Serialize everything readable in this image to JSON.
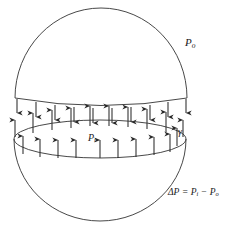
{
  "figure": {
    "stroke_color": "#333333",
    "arrow_color": "#2b2b2b",
    "background_color": "#ffffff",
    "labels": {
      "outside_pressure": {
        "symbol": "P",
        "subscript": "o",
        "meaning": "outside-pressure"
      },
      "inside_pressure": {
        "symbol": "P",
        "subscript": "i",
        "meaning": "inside-pressure"
      },
      "surface_tension": {
        "symbol": "γ",
        "meaning": "surface-tension"
      },
      "equation": {
        "lhs_symbol": "ΔP",
        "equals": "=",
        "term1_symbol": "P",
        "term1_sub": "i",
        "minus": "−",
        "term2_symbol": "P",
        "term2_sub": "o",
        "plain": "ΔP = Pᵢ − Pₒ"
      }
    },
    "geometry": {
      "sphere_center_x": 100,
      "sphere_radius_x": 86,
      "upper_cap_top_y": 11,
      "upper_cap_bottom_y": 100,
      "rim_ellipse_center_y": 139,
      "rim_ellipse_ry": 19,
      "lower_bowl_bottom_y": 221,
      "down_arrow_count": 10,
      "up_arrow_outer_count": 10,
      "up_arrow_inner_count": 10
    }
  }
}
